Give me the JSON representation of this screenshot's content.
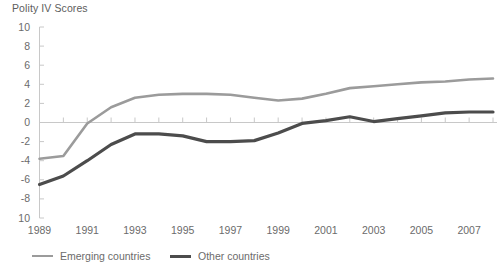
{
  "chart_data": {
    "type": "line",
    "title": "Polity IV Scores",
    "xlabel": "",
    "ylabel": "",
    "ylim": [
      -10,
      10
    ],
    "xlim": [
      1989,
      2008
    ],
    "grid": false,
    "zero_line": true,
    "legend_position": "bottom",
    "ytick_labels": [
      "10",
      "8",
      "6",
      "4",
      "2",
      "0",
      "-2",
      "-4",
      "-6",
      "-8",
      "10"
    ],
    "ytick_values": [
      10,
      8,
      6,
      4,
      2,
      0,
      -2,
      -4,
      -6,
      -8,
      -10
    ],
    "xtick_labels": [
      "1989",
      "1991",
      "1993",
      "1995",
      "1997",
      "1999",
      "2001",
      "2003",
      "2005",
      "2007"
    ],
    "xtick_values": [
      1989,
      1991,
      1993,
      1995,
      1997,
      1999,
      2001,
      2003,
      2005,
      2007
    ],
    "x": [
      1989,
      1990,
      1991,
      1992,
      1993,
      1994,
      1995,
      1996,
      1997,
      1998,
      1999,
      2000,
      2001,
      2002,
      2003,
      2004,
      2005,
      2006,
      2007,
      2008
    ],
    "series": [
      {
        "name": "Emerging countries",
        "color": "#9b9b9b",
        "width": 2.6,
        "values": [
          -3.8,
          -3.5,
          -0.1,
          1.6,
          2.6,
          2.9,
          3.0,
          3.0,
          2.9,
          2.6,
          2.3,
          2.5,
          3.0,
          3.6,
          3.8,
          4.0,
          4.2,
          4.3,
          4.5,
          4.6
        ]
      },
      {
        "name": "Other countries",
        "color": "#4c4c4c",
        "width": 3.2,
        "values": [
          -6.5,
          -5.6,
          -4.0,
          -2.3,
          -1.2,
          -1.2,
          -1.4,
          -2.0,
          -2.0,
          -1.9,
          -1.1,
          -0.1,
          0.2,
          0.6,
          0.1,
          0.4,
          0.7,
          1.0,
          1.1,
          1.1
        ]
      }
    ]
  },
  "legend": {
    "entries": [
      {
        "label": "Emerging countries"
      },
      {
        "label": "Other countries"
      }
    ]
  },
  "axes": {
    "axis_color": "#c8c8c8",
    "zero_line_color": "#c8c8c8",
    "tick_color": "#c8c8c8"
  }
}
